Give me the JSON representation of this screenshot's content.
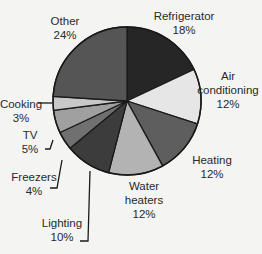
{
  "chart_data": {
    "type": "pie",
    "title": "",
    "start": "top",
    "direction": "clockwise",
    "slices": [
      {
        "label": "Refrigerator",
        "label_lines": [
          "Refrigerator",
          "18%"
        ],
        "value": 18,
        "color": "#262626"
      },
      {
        "label": "Air conditioning",
        "label_lines": [
          "Air",
          "conditioning",
          "12%"
        ],
        "value": 12,
        "color": "#e6e6e6"
      },
      {
        "label": "Heating",
        "label_lines": [
          "Heating",
          "12%"
        ],
        "value": 12,
        "color": "#5e5e5e"
      },
      {
        "label": "Water heaters",
        "label_lines": [
          "Water",
          "heaters",
          "12%"
        ],
        "value": 12,
        "color": "#b3b3b3"
      },
      {
        "label": "Lighting",
        "label_lines": [
          "Lighting",
          "10%"
        ],
        "value": 10,
        "color": "#3c3c3c"
      },
      {
        "label": "Freezers",
        "label_lines": [
          "Freezers",
          "4%"
        ],
        "value": 4,
        "color": "#707070"
      },
      {
        "label": "TV",
        "label_lines": [
          "TV",
          "5%"
        ],
        "value": 5,
        "color": "#a0a0a0"
      },
      {
        "label": "Cooking",
        "label_lines": [
          "Cooking",
          "3%"
        ],
        "value": 3,
        "color": "#c8c8c8"
      },
      {
        "label": "Other",
        "label_lines": [
          "Other",
          "24%"
        ],
        "value": 24,
        "color": "#555555"
      }
    ],
    "unit": "%"
  }
}
